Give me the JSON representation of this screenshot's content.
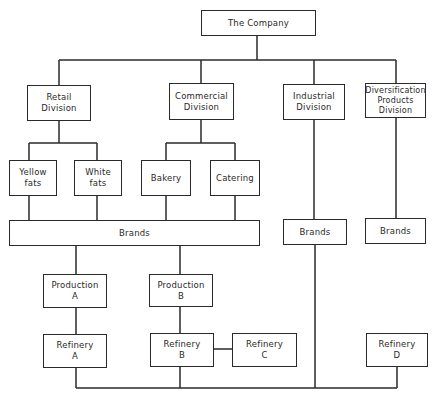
{
  "diagram": {
    "type": "org-chart",
    "nodes": {
      "company": "The Company",
      "retail": "Retail\nDivision",
      "commercial": "Commercial\nDivision",
      "industrial": "Industrial\nDivision",
      "diversification": "Diversification\nProducts\nDivision",
      "yellow_fats": "Yellow\nfats",
      "white_fats": "White\nfats",
      "bakery": "Bakery",
      "catering": "Catering",
      "brands_main": "Brands",
      "brands_industrial": "Brands",
      "brands_diversification": "Brands",
      "production_a": "Production\nA",
      "production_b": "Production\nB",
      "refinery_a": "Refinery\nA",
      "refinery_b": "Refinery\nB",
      "refinery_c": "Refinery\nC",
      "refinery_d": "Refinery\nD"
    },
    "edges": [
      [
        "company",
        "retail"
      ],
      [
        "company",
        "commercial"
      ],
      [
        "company",
        "industrial"
      ],
      [
        "company",
        "diversification"
      ],
      [
        "retail",
        "yellow_fats"
      ],
      [
        "retail",
        "white_fats"
      ],
      [
        "commercial",
        "bakery"
      ],
      [
        "commercial",
        "catering"
      ],
      [
        "yellow_fats",
        "brands_main"
      ],
      [
        "white_fats",
        "brands_main"
      ],
      [
        "bakery",
        "brands_main"
      ],
      [
        "catering",
        "brands_main"
      ],
      [
        "industrial",
        "brands_industrial"
      ],
      [
        "diversification",
        "brands_diversification"
      ],
      [
        "brands_main",
        "production_a"
      ],
      [
        "brands_main",
        "production_b"
      ],
      [
        "production_a",
        "refinery_a"
      ],
      [
        "production_b",
        "refinery_b"
      ],
      [
        "refinery_b",
        "refinery_c"
      ],
      [
        "brands_industrial",
        "refinery_bus"
      ],
      [
        "refinery_a",
        "refinery_bus"
      ],
      [
        "refinery_b",
        "refinery_bus"
      ],
      [
        "refinery_d",
        "refinery_bus"
      ]
    ]
  }
}
